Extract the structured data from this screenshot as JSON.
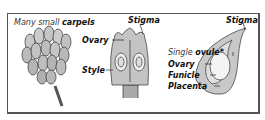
{
  "panels": [
    {
      "caption_prefix": "Many small",
      "caption_bold": "carpels"
    },
    {
      "labels": {
        "top": "Stigma",
        "ovary": "Ovary",
        "style": "Style"
      }
    },
    {
      "labels": {
        "top": "Stigma",
        "ovule_prefix": "Single",
        "ovule_bold": "ovule*",
        "ovary": "Ovary",
        "funicle": "Funicle",
        "placenta": "Placenta"
      }
    }
  ]
}
